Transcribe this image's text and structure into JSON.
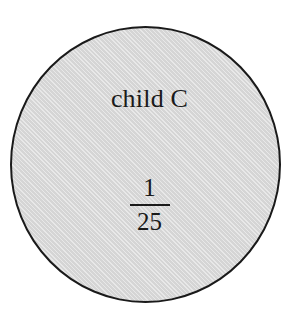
{
  "diagram": {
    "type": "shaded-circle-node",
    "canvas": {
      "width": 297,
      "height": 321,
      "background": "#ffffff"
    },
    "circle": {
      "name": "child-node-circle",
      "fill_color": "#d5d5d5",
      "border_color": "#1a1a1a",
      "border_width_px": 2,
      "center_x": 146,
      "center_y": 165,
      "diameter_px": 275
    },
    "node": {
      "label": "child C",
      "probability": {
        "numerator": "1",
        "denominator": "25",
        "display": "1/25"
      }
    },
    "text_color": "#1a1a1a"
  }
}
